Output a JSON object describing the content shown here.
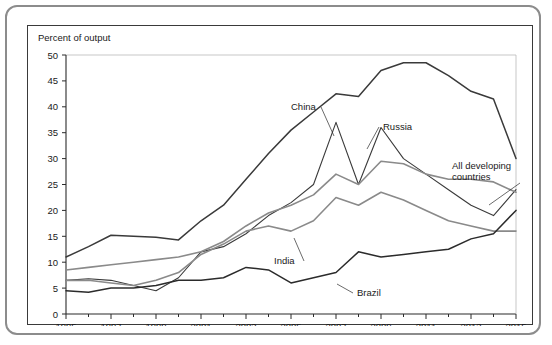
{
  "chart_data": {
    "type": "line",
    "title": "",
    "ylabel": "Percent of output",
    "xlabel": "",
    "ylim": [
      0,
      50
    ],
    "xlim": [
      1995,
      2015
    ],
    "ytick_step": 5,
    "yticks": [
      "0",
      "5",
      "10",
      "15",
      "20",
      "25",
      "30",
      "35",
      "40",
      "45",
      "50"
    ],
    "xticks": [
      "1995",
      "1997",
      "1999",
      "2001",
      "2003",
      "2005",
      "2007",
      "2009",
      "2011",
      "2013",
      "2015"
    ],
    "x": [
      1995,
      1996,
      1997,
      1998,
      1999,
      2000,
      2001,
      2002,
      2003,
      2004,
      2005,
      2006,
      2007,
      2008,
      2009,
      2010,
      2011,
      2012,
      2013,
      2014,
      2015
    ],
    "grid": false,
    "legend_position": "inline-annotations",
    "series": [
      {
        "name": "China",
        "color": "#3a3a3a",
        "width": 1.5,
        "values": [
          11,
          13,
          15.2,
          15,
          14.8,
          14.3,
          18,
          21,
          26,
          31,
          35.5,
          39,
          42.5,
          42,
          47,
          48.5,
          48.5,
          46,
          43,
          41.5,
          30
        ]
      },
      {
        "name": "Russia",
        "color": "#3a3a3a",
        "width": 1.1,
        "values": [
          6.5,
          6.8,
          6.5,
          5.5,
          4.5,
          7,
          12,
          13,
          15.5,
          19,
          21.5,
          25,
          37,
          25,
          36,
          30,
          27,
          24,
          21,
          19,
          24
        ]
      },
      {
        "name": "All developing countries",
        "color": "#8a8a8a",
        "width": 1.6,
        "values": [
          8.5,
          9,
          9.5,
          10,
          10.5,
          11,
          12,
          14,
          17,
          19.5,
          21,
          23,
          27,
          25,
          29.5,
          29,
          27,
          26,
          26,
          25.5,
          23.5
        ]
      },
      {
        "name": "India",
        "color": "#8a8a8a",
        "width": 1.6,
        "values": [
          6.5,
          6.5,
          6,
          5.5,
          6.5,
          8,
          11.5,
          13.5,
          16,
          17,
          16,
          18,
          22.5,
          21,
          23.5,
          22,
          20,
          18,
          17,
          16,
          16
        ]
      },
      {
        "name": "Brazil",
        "color": "#2b2b2b",
        "width": 1.5,
        "values": [
          4.5,
          4.2,
          5,
          5,
          5.5,
          6.5,
          6.5,
          7,
          9,
          8.5,
          6,
          7,
          8,
          12,
          11,
          11.5,
          12,
          12.5,
          14.5,
          15.5,
          20
        ]
      }
    ],
    "annotations": [
      {
        "name": "China",
        "text": "China",
        "lx": 263,
        "ly": 84,
        "px": 306,
        "py": 110
      },
      {
        "name": "Russia",
        "text": "Russia",
        "lx": 355,
        "ly": 104,
        "px": 339,
        "py": 123
      },
      {
        "name": "All developing countries",
        "text": "All developing",
        "text2": "countries",
        "lx": 424,
        "ly": 143,
        "px": 461,
        "py": 179
      },
      {
        "name": "India",
        "text": "India",
        "lx": 246,
        "ly": 238,
        "px": 266,
        "py": 212
      },
      {
        "name": "Brazil",
        "text": "Brazil",
        "lx": 329,
        "ly": 270,
        "px": 309,
        "py": 258
      }
    ]
  }
}
